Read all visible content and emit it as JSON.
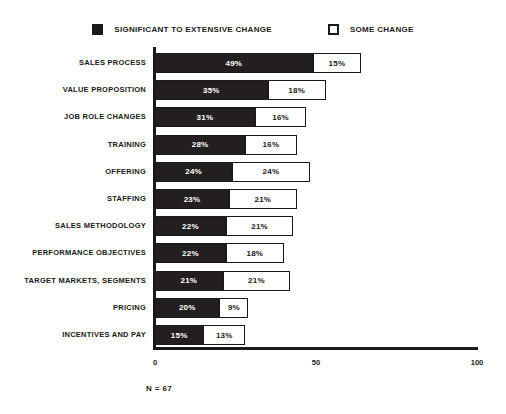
{
  "chart_data": {
    "type": "bar",
    "orientation": "horizontal",
    "stacked": true,
    "title": "",
    "xlabel": "",
    "ylabel": "",
    "xlim": [
      0,
      100
    ],
    "xticks": [
      0,
      50,
      100
    ],
    "grid": false,
    "legend_position": "top-center",
    "footnote": "N = 67",
    "categories": [
      "SALES PROCESS",
      "VALUE PROPOSITION",
      "JOB ROLE CHANGES",
      "TRAINING",
      "OFFERING",
      "STAFFING",
      "SALES METHODOLOGY",
      "PERFORMANCE OBJECTIVES",
      "TARGET MARKETS, SEGMENTS",
      "PRICING",
      "INCENTIVES AND PAY"
    ],
    "series": [
      {
        "name": "SIGNIFICANT TO EXTENSIVE CHANGE",
        "color": "#231f20",
        "values": [
          49,
          35,
          31,
          28,
          24,
          23,
          22,
          22,
          21,
          20,
          15
        ],
        "labels": [
          "49%",
          "35%",
          "31%",
          "28%",
          "24%",
          "23%",
          "22%",
          "22%",
          "21%",
          "20%",
          "15%"
        ]
      },
      {
        "name": "SOME CHANGE",
        "color": "#ffffff",
        "values": [
          15,
          18,
          16,
          16,
          24,
          21,
          21,
          18,
          21,
          9,
          13
        ],
        "labels": [
          "15%",
          "18%",
          "16%",
          "16%",
          "24%",
          "21%",
          "21%",
          "18%",
          "21%",
          "9%",
          "13%"
        ]
      }
    ]
  },
  "legend": {
    "items": [
      {
        "label": "SIGNIFICANT TO EXTENSIVE CHANGE",
        "marker": "filled-square-icon"
      },
      {
        "label": "SOME CHANGE",
        "marker": "hollow-square-icon"
      }
    ]
  },
  "axis": {
    "tick_labels": [
      "0",
      "50",
      "100"
    ]
  },
  "footnote": "N = 67"
}
